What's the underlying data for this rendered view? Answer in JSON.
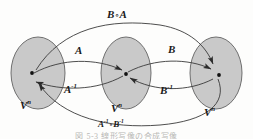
{
  "figure": {
    "type": "commutative-diagram",
    "background_color": "#fdfdfc",
    "ellipse_fill": "#c9c9c9",
    "ellipse_stroke": "#6f6f6f",
    "curve_color": "#3a3a3a",
    "text_color": "#1a1a1a"
  },
  "sets": [
    {
      "id": "left",
      "label_base": "V",
      "label_sup": "n",
      "label_full": "Vⁿ"
    },
    {
      "id": "middle",
      "label_base": "V",
      "label_sup": "n",
      "label_full": "Vⁿ"
    },
    {
      "id": "right",
      "label_base": "V",
      "label_sup": "n",
      "label_full": "Vⁿ"
    }
  ],
  "maps": {
    "a": {
      "base": "A",
      "sup": "",
      "full": "A"
    },
    "a_inverse": {
      "base": "A",
      "sup": "-1",
      "full": "A⁻¹"
    },
    "b": {
      "base": "B",
      "sup": "",
      "full": "B"
    },
    "b_inverse": {
      "base": "B",
      "sup": "-1",
      "full": "B⁻¹"
    }
  },
  "compositions": {
    "top": {
      "left_base": "B",
      "left_sup": "",
      "operator": "∘",
      "right_base": "A",
      "right_sup": "",
      "full": "B∘A"
    },
    "bottom": {
      "left_base": "A",
      "left_sup": "-1",
      "operator": "∘",
      "right_base": "B",
      "right_sup": "-1",
      "full": "A⁻¹∘B⁻¹"
    }
  },
  "caption": {
    "text": "図 5-3   線形写像の合成写像"
  }
}
